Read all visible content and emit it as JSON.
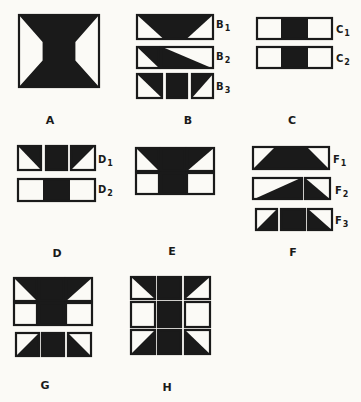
{
  "colors": {
    "ink": "#1a1a1a",
    "paper": "#fbfaf6"
  },
  "figures": {
    "A": {
      "label": "A",
      "label_pos": [
        50,
        120
      ]
    },
    "B": {
      "label": "B",
      "label_pos": [
        188,
        120
      ],
      "parts": [
        {
          "label": "B",
          "num": "1",
          "pos": [
            216,
            25
          ]
        },
        {
          "label": "B",
          "num": "2",
          "pos": [
            216,
            57
          ]
        },
        {
          "label": "B",
          "num": "3",
          "pos": [
            216,
            87
          ]
        }
      ]
    },
    "C": {
      "label": "C",
      "label_pos": [
        292,
        120
      ],
      "parts": [
        {
          "label": "C",
          "num": "1",
          "pos": [
            336,
            30
          ]
        },
        {
          "label": "C",
          "num": "2",
          "pos": [
            336,
            59
          ]
        }
      ]
    },
    "D": {
      "label": "D",
      "label_pos": [
        57,
        253
      ],
      "parts": [
        {
          "label": "D",
          "num": "1",
          "pos": [
            98,
            160
          ]
        },
        {
          "label": "D",
          "num": "2",
          "pos": [
            98,
            190
          ]
        }
      ]
    },
    "E": {
      "label": "E",
      "label_pos": [
        172,
        251
      ]
    },
    "F": {
      "label": "F",
      "label_pos": [
        293,
        252
      ],
      "parts": [
        {
          "label": "F",
          "num": "1",
          "pos": [
            333,
            160
          ]
        },
        {
          "label": "F",
          "num": "2",
          "pos": [
            335,
            191
          ]
        },
        {
          "label": "F",
          "num": "3",
          "pos": [
            335,
            221
          ]
        }
      ]
    },
    "G": {
      "label": "G",
      "label_pos": [
        45,
        385
      ]
    },
    "H": {
      "label": "H",
      "label_pos": [
        167,
        387
      ]
    }
  },
  "shapes": [
    {
      "fig": "A",
      "x": 18,
      "y": 14,
      "w": 82,
      "h": 74,
      "fill": "hourglass"
    },
    {
      "fig": "B1",
      "x": 136,
      "y": 14,
      "w": 78,
      "h": 26,
      "fill": "trap-down"
    },
    {
      "fig": "B2",
      "x": 136,
      "y": 46,
      "w": 24,
      "h": 23,
      "fill": "tri-tr"
    },
    {
      "fig": "B2",
      "x": 160,
      "y": 46,
      "w": 54,
      "h": 23,
      "fill": "tri-bl"
    },
    {
      "fig": "B3",
      "x": 136,
      "y": 73,
      "w": 27,
      "h": 26,
      "fill": "tri-tr"
    },
    {
      "fig": "B3",
      "x": 166,
      "y": 73,
      "w": 22,
      "h": 26,
      "fill": "solid"
    },
    {
      "fig": "B3",
      "x": 191,
      "y": 73,
      "w": 23,
      "h": 26,
      "fill": "tri-tl"
    },
    {
      "fig": "C1",
      "x": 256,
      "y": 17,
      "w": 77,
      "h": 23,
      "fill": "center-band",
      "band": [
        25,
        52
      ]
    },
    {
      "fig": "C2",
      "x": 256,
      "y": 46,
      "w": 77,
      "h": 23,
      "fill": "center-band",
      "band": [
        25,
        52
      ]
    },
    {
      "fig": "D1",
      "x": 17,
      "y": 145,
      "w": 25,
      "h": 26,
      "fill": "tri-tr"
    },
    {
      "fig": "D1",
      "x": 45,
      "y": 145,
      "w": 23,
      "h": 26,
      "fill": "solid"
    },
    {
      "fig": "D1",
      "x": 70,
      "y": 145,
      "w": 26,
      "h": 26,
      "fill": "tri-tl"
    },
    {
      "fig": "D2",
      "x": 17,
      "y": 178,
      "w": 79,
      "h": 24,
      "fill": "center-band",
      "band": [
        26,
        53
      ]
    },
    {
      "fig": "E",
      "x": 135,
      "y": 147,
      "w": 25,
      "h": 25,
      "fill": "tri-tr"
    },
    {
      "fig": "E",
      "x": 160,
      "y": 147,
      "w": 26,
      "h": 25,
      "fill": "solid"
    },
    {
      "fig": "E",
      "x": 186,
      "y": 147,
      "w": 29,
      "h": 25,
      "fill": "tri-tl"
    },
    {
      "fig": "E",
      "x": 135,
      "y": 172,
      "w": 25,
      "h": 23,
      "fill": "empty"
    },
    {
      "fig": "E",
      "x": 160,
      "y": 172,
      "w": 26,
      "h": 23,
      "fill": "solid"
    },
    {
      "fig": "E",
      "x": 186,
      "y": 172,
      "w": 29,
      "h": 23,
      "fill": "empty"
    },
    {
      "fig": "F1",
      "x": 252,
      "y": 146,
      "w": 78,
      "h": 24,
      "fill": "trap-up"
    },
    {
      "fig": "F2",
      "x": 252,
      "y": 177,
      "w": 51,
      "h": 23,
      "fill": "tri-br"
    },
    {
      "fig": "F2",
      "x": 304,
      "y": 177,
      "w": 27,
      "h": 23,
      "fill": "tri-bl"
    },
    {
      "fig": "F3",
      "x": 255,
      "y": 208,
      "w": 23,
      "h": 23,
      "fill": "tri-br"
    },
    {
      "fig": "F3",
      "x": 280,
      "y": 208,
      "w": 26,
      "h": 23,
      "fill": "solid"
    },
    {
      "fig": "F3",
      "x": 307,
      "y": 208,
      "w": 26,
      "h": 23,
      "fill": "tri-bl"
    },
    {
      "fig": "G",
      "x": 13,
      "y": 277,
      "w": 25,
      "h": 25,
      "fill": "tri-tr"
    },
    {
      "fig": "G",
      "x": 38,
      "y": 277,
      "w": 27,
      "h": 25,
      "fill": "solid"
    },
    {
      "fig": "G",
      "x": 65,
      "y": 277,
      "w": 28,
      "h": 25,
      "fill": "tri-tl"
    },
    {
      "fig": "G",
      "x": 13,
      "y": 302,
      "w": 25,
      "h": 24,
      "fill": "empty"
    },
    {
      "fig": "G",
      "x": 38,
      "y": 302,
      "w": 27,
      "h": 24,
      "fill": "solid"
    },
    {
      "fig": "G",
      "x": 65,
      "y": 302,
      "w": 28,
      "h": 24,
      "fill": "empty"
    },
    {
      "fig": "G",
      "x": 15,
      "y": 332,
      "w": 25,
      "h": 25,
      "fill": "tri-br"
    },
    {
      "fig": "G",
      "x": 41,
      "y": 332,
      "w": 24,
      "h": 25,
      "fill": "solid"
    },
    {
      "fig": "G",
      "x": 67,
      "y": 332,
      "w": 25,
      "h": 25,
      "fill": "tri-bl"
    },
    {
      "fig": "H",
      "x": 130,
      "y": 276,
      "w": 26,
      "h": 24,
      "fill": "tri-tr"
    },
    {
      "fig": "H",
      "x": 157,
      "y": 276,
      "w": 25,
      "h": 24,
      "fill": "solid"
    },
    {
      "fig": "H",
      "x": 184,
      "y": 276,
      "w": 27,
      "h": 24,
      "fill": "tri-tl"
    },
    {
      "fig": "H",
      "x": 130,
      "y": 301,
      "w": 26,
      "h": 27,
      "fill": "empty"
    },
    {
      "fig": "H",
      "x": 157,
      "y": 301,
      "w": 25,
      "h": 27,
      "fill": "solid"
    },
    {
      "fig": "H",
      "x": 184,
      "y": 301,
      "w": 27,
      "h": 27,
      "fill": "empty"
    },
    {
      "fig": "H",
      "x": 130,
      "y": 329,
      "w": 26,
      "h": 26,
      "fill": "tri-br"
    },
    {
      "fig": "H",
      "x": 157,
      "y": 329,
      "w": 25,
      "h": 26,
      "fill": "solid"
    },
    {
      "fig": "H",
      "x": 184,
      "y": 329,
      "w": 27,
      "h": 26,
      "fill": "tri-bl"
    }
  ]
}
